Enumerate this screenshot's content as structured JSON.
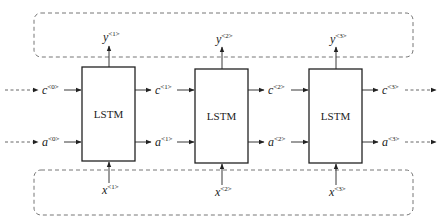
{
  "diagram": {
    "type": "LSTM unrolled network",
    "cells": [
      {
        "label": "LSTM",
        "x": 82,
        "y": 67,
        "w": 53,
        "h": 94,
        "y_out": "y",
        "y_sup": "<1>",
        "x_in": "x",
        "x_sup": "<1>"
      },
      {
        "label": "LSTM",
        "x": 195,
        "y": 69,
        "w": 53,
        "h": 94,
        "y_out": "y",
        "y_sup": "<2>",
        "x_in": "x",
        "x_sup": "<2>"
      },
      {
        "label": "LSTM",
        "x": 309,
        "y": 69,
        "w": 53,
        "h": 94,
        "y_out": "y",
        "y_sup": "<3>",
        "x_in": "x",
        "x_sup": "<3>"
      }
    ],
    "cell_states": [
      {
        "base": "c",
        "sup": "<0>"
      },
      {
        "base": "c",
        "sup": "<1>"
      },
      {
        "base": "c",
        "sup": "<2>"
      },
      {
        "base": "c",
        "sup": "<3>"
      }
    ],
    "hidden_states": [
      {
        "base": "a",
        "sup": "<0>"
      },
      {
        "base": "a",
        "sup": "<1>"
      },
      {
        "base": "a",
        "sup": "<2>"
      },
      {
        "base": "a",
        "sup": "<3>"
      }
    ],
    "colors": {
      "stroke": "#222222",
      "dashed": "#666666",
      "background": "#ffffff"
    }
  }
}
